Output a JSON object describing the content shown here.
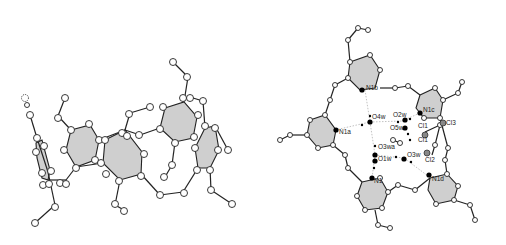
{
  "figure": {
    "panels": [
      {
        "id": "left",
        "description": "side view of macrocycle ball-and-stick model"
      },
      {
        "id": "right",
        "description": "top view of macrocycle with water cluster and chloroform"
      }
    ],
    "labels": {
      "N1b": "N1b",
      "N1a": "N1a",
      "N1c": "N1c",
      "N1d": "N1d",
      "N1": "N1",
      "O4w": "O4w",
      "O2w": "O2w",
      "O5w": "O5w",
      "O3wa": "O3wa",
      "O1w": "O1w",
      "O3w": "O3w",
      "Cl1": "Cl1",
      "Cl1b": "Cl1",
      "Cl2": "Cl2",
      "Cl3": "Cl3"
    },
    "colors": {
      "ring_fill": "#cfcfcf",
      "bond": "#222222",
      "background": "#ffffff"
    }
  }
}
